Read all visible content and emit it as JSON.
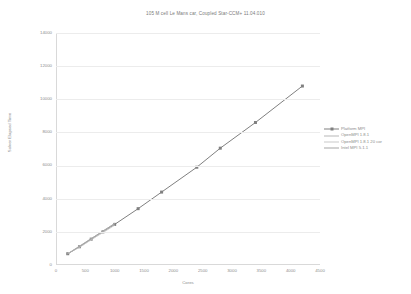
{
  "chart_data": {
    "type": "line",
    "title": "105 M cell Le Mans car, Coupled Star-CCM+ 11.04.010",
    "xlabel": "Cores",
    "ylabel": "Solver Elapsed Time",
    "xlim": [
      0,
      4500
    ],
    "ylim": [
      0,
      14000
    ],
    "grid": true,
    "legend_position": "right",
    "xticks": [
      "0",
      "500",
      "1000",
      "1500",
      "2000",
      "2500",
      "3000",
      "3500",
      "4000",
      "4500"
    ],
    "xtick_values": [
      0,
      500,
      1000,
      1500,
      2000,
      2500,
      3000,
      3500,
      4000,
      4500
    ],
    "yticks": [
      "0",
      "2000",
      "4000",
      "6000",
      "8000",
      "10000",
      "12000",
      "14000"
    ],
    "ytick_values": [
      0,
      2000,
      4000,
      6000,
      8000,
      10000,
      12000,
      14000
    ],
    "series": [
      {
        "name": "Platform MPI",
        "color": "#808080",
        "marker": "square",
        "marker_size": 3,
        "line_width": 1,
        "x": [
          200,
          400,
          600,
          800,
          1000,
          1400,
          1800,
          2400,
          2800,
          3400,
          4200
        ],
        "y": [
          680,
          1100,
          1560,
          2000,
          2450,
          3400,
          4400,
          5900,
          7050,
          8600,
          10800
        ]
      },
      {
        "name": "OpenMPI 1.8.1",
        "color": "#b8b8b8",
        "marker": "none",
        "marker_size": 0,
        "line_width": 1,
        "x": [
          200,
          400,
          600,
          800,
          1000
        ],
        "y": [
          680,
          1140,
          1600,
          2020,
          2520
        ]
      },
      {
        "name": "OpenMPI 1.8.1 20 cor",
        "color": "#c9c9c9",
        "marker": "none",
        "marker_size": 0,
        "line_width": 1,
        "x": [
          200,
          400,
          600,
          800,
          1000
        ],
        "y": [
          700,
          1060,
          1520,
          1960,
          2400
        ]
      },
      {
        "name": "Intel MPI 5.1.1",
        "color": "#a6a6a6",
        "marker": "none",
        "marker_size": 0,
        "line_width": 1,
        "x": [
          200,
          400,
          600,
          800,
          1000
        ],
        "y": [
          660,
          1120,
          1580,
          2060,
          2480
        ]
      }
    ]
  },
  "colors": {
    "axis": "#d9d9d9",
    "grid": "#ececec",
    "text": "#8c8c8c",
    "title": "#7a7a7a",
    "background": "#ffffff"
  }
}
